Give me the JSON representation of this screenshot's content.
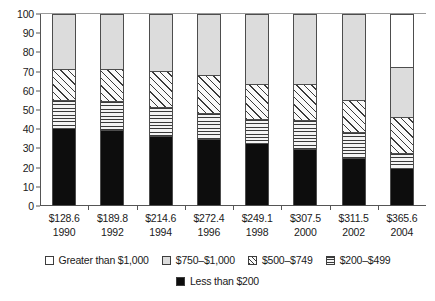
{
  "chart_data": {
    "type": "bar",
    "title": "",
    "xlabel": "",
    "ylabel": "",
    "ylim": [
      0,
      100
    ],
    "grid": false,
    "stacked": true,
    "stack_mode": "percent",
    "legend_position": "bottom",
    "categories": [
      "1990",
      "1992",
      "1994",
      "1996",
      "1998",
      "2000",
      "2002",
      "2004"
    ],
    "category_amounts": [
      "$128.6",
      "$189.8",
      "$214.6",
      "$272.4",
      "$249.1",
      "$307.5",
      "$311.5",
      "$365.6"
    ],
    "y_ticks": [
      0,
      10,
      20,
      30,
      40,
      50,
      60,
      70,
      80,
      90,
      100
    ],
    "series": [
      {
        "name": "Less than $200",
        "pattern": "solid-black",
        "values": [
          40,
          39,
          36,
          34,
          32,
          29,
          24,
          19
        ]
      },
      {
        "name": "$200–$499",
        "pattern": "horizontal-lines",
        "values": [
          15,
          15,
          15,
          14,
          13,
          15,
          14,
          8
        ]
      },
      {
        "name": "$500–$749",
        "pattern": "diagonal-hatch",
        "values": [
          16,
          17,
          19,
          20,
          18,
          19,
          17,
          19
        ]
      },
      {
        "name": "$750–$1,000",
        "pattern": "light-gray",
        "values": [
          29,
          29,
          30,
          32,
          37,
          37,
          45,
          26
        ]
      },
      {
        "name": "Greater than $1,000",
        "pattern": "white",
        "values": [
          0,
          0,
          0,
          0,
          0,
          0,
          0,
          28
        ]
      }
    ]
  },
  "legend": {
    "row1": [
      {
        "label": "Greater than $1,000",
        "pattern": "white"
      },
      {
        "label": "$750–$1,000",
        "pattern": "light-gray"
      },
      {
        "label": "$500–$749",
        "pattern": "diagonal-hatch"
      },
      {
        "label": "$200–$499",
        "pattern": "horizontal-lines"
      }
    ],
    "row2": [
      {
        "label": "Less than $200",
        "pattern": "solid-black"
      }
    ]
  },
  "colors": {
    "black": "#0d0d0d",
    "gray": "#dcdcdc",
    "white": "#ffffff",
    "axis": "#555555",
    "text": "#1a1a1a"
  }
}
